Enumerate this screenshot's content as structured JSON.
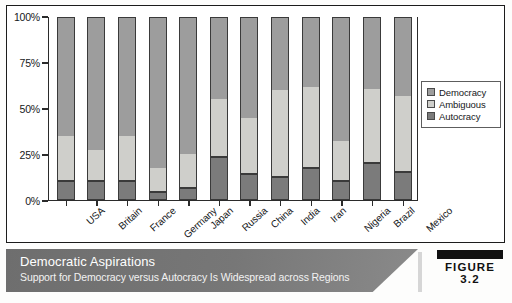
{
  "figure": {
    "tag": "FIGURE 3.2",
    "title": "Democratic Aspirations",
    "subtitle": "Support for Democracy versus Autocracy Is Widespread across Regions"
  },
  "legend": {
    "items": [
      {
        "label": "Democracy",
        "color": "#9d9d9d"
      },
      {
        "label": "Ambiguous",
        "color": "#cfcfcb"
      },
      {
        "label": "Autocracy",
        "color": "#7b7b7b"
      }
    ]
  },
  "axis": {
    "y_ticks": [
      "100%",
      "75%",
      "50%",
      "25%",
      "0%"
    ]
  },
  "chart_data": {
    "type": "bar",
    "stacked": true,
    "title": "Democratic Aspirations",
    "subtitle": "Support for Democracy versus Autocracy Is Widespread across Regions",
    "xlabel": "",
    "ylabel": "",
    "ylim": [
      0,
      100
    ],
    "ytick_labels": [
      "0%",
      "25%",
      "50%",
      "75%",
      "100%"
    ],
    "ytick_values": [
      0,
      25,
      50,
      75,
      100
    ],
    "grid": false,
    "legend_position": "right",
    "categories": [
      "USA",
      "Britain",
      "France",
      "Germany",
      "Japan",
      "Russia",
      "China",
      "India",
      "Iran",
      "Nigeria",
      "Brazil",
      "Mexico"
    ],
    "series": [
      {
        "name": "Autocracy",
        "color": "#7b7b7b",
        "values": [
          10,
          10,
          10,
          4,
          6,
          23,
          14,
          12,
          17,
          10,
          20,
          15
        ]
      },
      {
        "name": "Ambiguous",
        "color": "#cfcfcb",
        "values": [
          25,
          17,
          25,
          13,
          19,
          32,
          31,
          48,
          45,
          22,
          41,
          42
        ]
      },
      {
        "name": "Democracy",
        "color": "#9d9d9d",
        "values": [
          65,
          73,
          65,
          83,
          75,
          45,
          55,
          40,
          38,
          68,
          39,
          43
        ]
      }
    ],
    "totals": [
      100,
      100,
      100,
      100,
      100,
      100,
      100,
      100,
      100,
      100,
      100,
      100
    ]
  }
}
